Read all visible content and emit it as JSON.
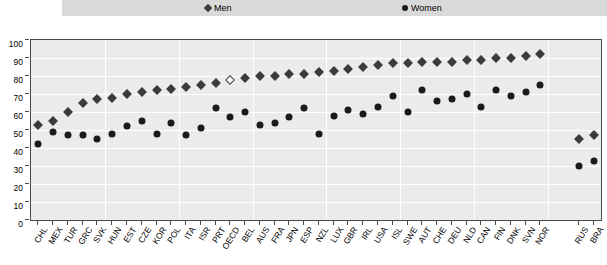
{
  "legend": {
    "men": {
      "label": "Men",
      "marker": "diamond-icon",
      "color": "#3b3b3b"
    },
    "women": {
      "label": "Women",
      "marker": "circle-icon",
      "color": "#1a1a1a"
    }
  },
  "chart_data": {
    "type": "scatter",
    "title": "",
    "xlabel": "",
    "ylabel": "",
    "ylim": [
      0,
      100
    ],
    "yticks": [
      0,
      10,
      20,
      30,
      40,
      50,
      60,
      70,
      80,
      90,
      100
    ],
    "grid": true,
    "legend_position": "top",
    "highlight_category": "OECD",
    "highlight_style": "open-diamond",
    "gap_after": "NOR",
    "categories": [
      "CHL",
      "MEX",
      "TUR",
      "GRC",
      "SVK",
      "HUN",
      "EST",
      "CZE",
      "KOR",
      "POL",
      "ITA",
      "ISR",
      "PRT",
      "OECD",
      "BEL",
      "AUS",
      "FRA",
      "JPN",
      "ESP",
      "NZL",
      "LUX",
      "GBR",
      "IRL",
      "USA",
      "ISL",
      "SWE",
      "AUT",
      "CHE",
      "DEU",
      "NLD",
      "CAN",
      "FIN",
      "DNK",
      "SVN",
      "NOR",
      "RUS",
      "BRA"
    ],
    "series": [
      {
        "name": "Men",
        "marker": "diamond",
        "color": "#3b3b3b",
        "values": [
          53,
          55,
          60,
          65,
          67,
          68,
          70,
          71,
          72,
          73,
          74,
          75,
          76,
          78,
          79,
          80,
          80,
          81,
          81,
          82,
          83,
          84,
          85,
          86,
          87,
          87,
          88,
          88,
          88,
          89,
          89,
          90,
          90,
          91,
          92,
          45,
          47
        ]
      },
      {
        "name": "Women",
        "marker": "circle",
        "color": "#1a1a1a",
        "values": [
          42,
          49,
          47,
          47,
          45,
          48,
          52,
          55,
          48,
          54,
          47,
          51,
          62,
          57,
          60,
          53,
          54,
          57,
          62,
          48,
          58,
          61,
          59,
          63,
          69,
          60,
          72,
          66,
          67,
          70,
          63,
          72,
          69,
          71,
          75,
          30,
          33
        ]
      }
    ]
  }
}
